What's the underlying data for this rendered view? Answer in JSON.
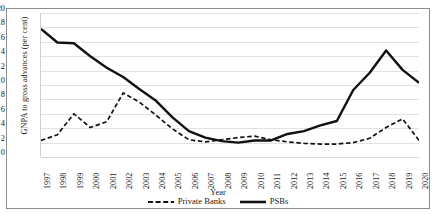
{
  "chart_data": {
    "type": "line",
    "title": "",
    "xlabel": "Year",
    "ylabel": "GNPA to gross advances (per cent)",
    "ylim": [
      0,
      20
    ],
    "ytick_step": 2,
    "yticks": [
      20,
      18,
      16,
      14,
      12,
      10,
      8,
      6,
      4,
      2,
      0
    ],
    "grid": true,
    "legend_position": "bottom",
    "categories": [
      "1997",
      "1998",
      "1999",
      "2000",
      "2001",
      "2002",
      "2003",
      "2004",
      "2005",
      "2006",
      "2007",
      "2008",
      "2009",
      "2010",
      "2011",
      "2012",
      "2013",
      "2014",
      "2015",
      "2016",
      "2017",
      "2018",
      "2019",
      "2020"
    ],
    "series": [
      {
        "name": "Private Banks",
        "style": "dashed",
        "color": "#111111",
        "values": [
          2.3,
          3.1,
          6.0,
          4.1,
          4.9,
          8.9,
          7.6,
          5.8,
          3.9,
          2.4,
          2.1,
          2.4,
          2.7,
          2.9,
          2.4,
          2.1,
          1.9,
          1.8,
          1.8,
          2.0,
          2.6,
          4.1,
          5.3,
          2.3
        ]
      },
      {
        "name": "PSBs",
        "style": "solid",
        "color": "#111111",
        "values": [
          17.8,
          15.9,
          15.8,
          14.0,
          12.4,
          11.1,
          9.4,
          7.8,
          5.5,
          3.6,
          2.7,
          2.2,
          2.0,
          2.3,
          2.3,
          3.2,
          3.6,
          4.4,
          5.0,
          9.3,
          11.7,
          14.8,
          12.1,
          10.3
        ]
      }
    ]
  }
}
